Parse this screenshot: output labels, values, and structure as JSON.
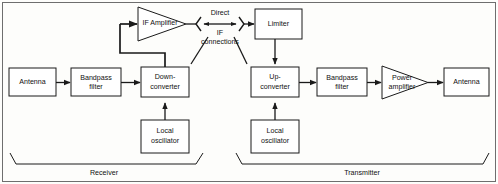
{
  "diagram": {
    "blocks": {
      "rx_antenna": "Antenna",
      "rx_bandpass_l1": "Bandpass",
      "rx_bandpass_l2": "filter",
      "down_converter_l1": "Down-",
      "down_converter_l2": "converter",
      "if_amplifier": "IF Amplifier",
      "rx_local_osc_l1": "Local",
      "rx_local_osc_l2": "oscillator",
      "limiter": "Limiter",
      "up_converter_l1": "Up-",
      "up_converter_l2": "converter",
      "tx_bandpass_l1": "Bandpass",
      "tx_bandpass_l2": "filter",
      "power_amplifier_l1": "Power",
      "power_amplifier_l2": "amplifier",
      "tx_local_osc_l1": "Local",
      "tx_local_osc_l2": "oscillator",
      "tx_antenna": "Antenna"
    },
    "connection_label": {
      "line1": "Direct",
      "line2": "IF",
      "line3": "connections"
    },
    "sections": {
      "receiver": "Receiver",
      "transmitter": "Transmitter"
    },
    "colors": {
      "stroke": "#1a1a1a",
      "fill": "#ffffff",
      "frame": "#6e6e6e",
      "background": "#fdfdfb"
    }
  }
}
